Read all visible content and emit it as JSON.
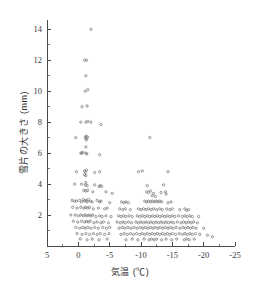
{
  "chart_data": {
    "type": "scatter",
    "title": "",
    "xlabel": "気温 (℃)",
    "ylabel": "雪片の大きさ (mm)",
    "xlim": [
      5,
      -25
    ],
    "ylim": [
      0,
      14.6
    ],
    "x_ticks": [
      5,
      0,
      -5,
      -10,
      -15,
      -20,
      -25
    ],
    "x_tick_labels": [
      "5",
      "0",
      "-5",
      "-10",
      "-15",
      "-20",
      "-25"
    ],
    "x_minor_step": 2.5,
    "y_ticks": [
      2,
      4,
      6,
      8,
      10,
      12,
      14
    ],
    "y_tick_labels": [
      "2",
      "4",
      "6",
      "8",
      "10",
      "12",
      "14"
    ],
    "y_minor_step": 1,
    "grid": false,
    "legend": null,
    "marker": "open-circle",
    "marker_color": "#6e6e6e",
    "axis_color": "#4a4a4a",
    "x_axis_inverted": true,
    "points": [
      [
        -2.0,
        14.0
      ],
      [
        -1.0,
        12.0
      ],
      [
        -1.3,
        12.0
      ],
      [
        -1.2,
        11.0
      ],
      [
        -1.1,
        10.0
      ],
      [
        -1.5,
        10.1
      ],
      [
        -0.6,
        9.0
      ],
      [
        -1.4,
        9.05
      ],
      [
        -0.4,
        8.0
      ],
      [
        -1.2,
        8.0
      ],
      [
        -1.5,
        8.05
      ],
      [
        -2.0,
        8.0
      ],
      [
        -3.6,
        7.85
      ],
      [
        0.4,
        7.0
      ],
      [
        -1.1,
        7.0
      ],
      [
        -1.2,
        7.1
      ],
      [
        -1.35,
        6.95
      ],
      [
        -1.45,
        7.05
      ],
      [
        -1.25,
        6.85
      ],
      [
        -11.4,
        7.0
      ],
      [
        -1.2,
        6.4
      ],
      [
        -0.4,
        6.0
      ],
      [
        -0.55,
        6.0
      ],
      [
        -0.7,
        6.05
      ],
      [
        -1.2,
        6.0
      ],
      [
        -1.35,
        5.95
      ],
      [
        -3.4,
        5.9
      ],
      [
        0.3,
        4.8
      ],
      [
        -1.0,
        4.85
      ],
      [
        -1.15,
        4.75
      ],
      [
        -1.3,
        4.9
      ],
      [
        -1.0,
        4.6
      ],
      [
        -1.2,
        4.55
      ],
      [
        -2.6,
        4.75
      ],
      [
        -3.4,
        4.8
      ],
      [
        -9.6,
        4.8
      ],
      [
        -10.2,
        4.85
      ],
      [
        -14.3,
        4.8
      ],
      [
        0.6,
        4.0
      ],
      [
        -0.5,
        4.0
      ],
      [
        -1.1,
        3.95
      ],
      [
        -1.2,
        4.1
      ],
      [
        -1.4,
        3.9
      ],
      [
        -2.6,
        3.95
      ],
      [
        -3.3,
        3.85
      ],
      [
        -3.5,
        3.9
      ],
      [
        -3.7,
        3.85
      ],
      [
        -11.0,
        3.9
      ],
      [
        -13.6,
        3.95
      ],
      [
        -0.9,
        3.6
      ],
      [
        -1.2,
        3.55
      ],
      [
        -1.5,
        3.6
      ],
      [
        -2.3,
        3.5
      ],
      [
        -4.4,
        3.5
      ],
      [
        -5.4,
        3.4
      ],
      [
        -10.9,
        3.5
      ],
      [
        -11.2,
        3.45
      ],
      [
        -11.5,
        3.55
      ],
      [
        -12.0,
        3.4
      ],
      [
        -13.2,
        3.45
      ],
      [
        -13.9,
        3.5
      ],
      [
        -14.0,
        3.35
      ],
      [
        -11.8,
        3.25
      ],
      [
        -12.3,
        3.2
      ],
      [
        1.0,
        2.95
      ],
      [
        0.6,
        2.9
      ],
      [
        0.3,
        2.9
      ],
      [
        -0.2,
        2.95
      ],
      [
        -0.5,
        2.85
      ],
      [
        -0.8,
        3.0
      ],
      [
        -1.0,
        2.9
      ],
      [
        -1.2,
        2.95
      ],
      [
        -1.4,
        2.85
      ],
      [
        -1.6,
        3.0
      ],
      [
        -1.9,
        2.9
      ],
      [
        -2.2,
        2.85
      ],
      [
        -3.0,
        2.95
      ],
      [
        -3.4,
        2.85
      ],
      [
        -3.6,
        2.9
      ],
      [
        -5.0,
        2.8
      ],
      [
        -6.9,
        2.85
      ],
      [
        -7.3,
        2.8
      ],
      [
        -7.6,
        2.85
      ],
      [
        -8.0,
        2.8
      ],
      [
        -10.6,
        2.9
      ],
      [
        -10.9,
        2.85
      ],
      [
        -11.2,
        2.9
      ],
      [
        -11.5,
        2.85
      ],
      [
        -11.8,
        2.9
      ],
      [
        -12.1,
        2.85
      ],
      [
        -12.4,
        2.9
      ],
      [
        -12.7,
        2.85
      ],
      [
        -13.0,
        2.9
      ],
      [
        -13.3,
        2.85
      ],
      [
        -14.3,
        2.8
      ],
      [
        -14.8,
        2.85
      ],
      [
        0.9,
        2.5
      ],
      [
        0.2,
        2.45
      ],
      [
        -0.4,
        2.5
      ],
      [
        -0.9,
        2.45
      ],
      [
        -1.2,
        2.5
      ],
      [
        -1.5,
        2.45
      ],
      [
        -1.8,
        2.5
      ],
      [
        -2.4,
        2.4
      ],
      [
        -3.2,
        2.45
      ],
      [
        -4.2,
        2.4
      ],
      [
        -4.6,
        2.45
      ],
      [
        -6.6,
        2.4
      ],
      [
        -7.1,
        2.35
      ],
      [
        -7.5,
        2.4
      ],
      [
        -8.3,
        2.35
      ],
      [
        -9.6,
        2.4
      ],
      [
        -10.0,
        2.35
      ],
      [
        -10.4,
        2.4
      ],
      [
        -10.8,
        2.35
      ],
      [
        -11.2,
        2.4
      ],
      [
        -11.6,
        2.35
      ],
      [
        -12.0,
        2.4
      ],
      [
        -12.5,
        2.35
      ],
      [
        -13.0,
        2.4
      ],
      [
        -13.4,
        2.35
      ],
      [
        -14.1,
        2.4
      ],
      [
        -14.6,
        2.35
      ],
      [
        -15.0,
        2.4
      ],
      [
        -16.2,
        2.35
      ],
      [
        -17.0,
        2.4
      ],
      [
        -17.3,
        2.3
      ],
      [
        -17.6,
        2.35
      ],
      [
        1.2,
        2.0
      ],
      [
        0.5,
        2.0
      ],
      [
        0.0,
        1.95
      ],
      [
        -0.4,
        2.0
      ],
      [
        -0.8,
        1.95
      ],
      [
        -1.1,
        2.0
      ],
      [
        -1.4,
        1.95
      ],
      [
        -1.7,
        2.0
      ],
      [
        -2.0,
        1.95
      ],
      [
        -2.3,
        2.0
      ],
      [
        -2.8,
        1.9
      ],
      [
        -3.4,
        1.95
      ],
      [
        -3.8,
        1.9
      ],
      [
        -4.4,
        1.95
      ],
      [
        -5.2,
        1.9
      ],
      [
        -6.4,
        1.95
      ],
      [
        -6.8,
        1.9
      ],
      [
        -7.2,
        1.95
      ],
      [
        -7.6,
        1.9
      ],
      [
        -8.1,
        1.95
      ],
      [
        -8.6,
        1.9
      ],
      [
        -9.4,
        1.95
      ],
      [
        -9.8,
        1.9
      ],
      [
        -10.2,
        1.95
      ],
      [
        -10.6,
        1.9
      ],
      [
        -11.0,
        1.95
      ],
      [
        -11.4,
        1.9
      ],
      [
        -11.8,
        1.95
      ],
      [
        -12.2,
        1.9
      ],
      [
        -12.6,
        1.95
      ],
      [
        -13.0,
        1.9
      ],
      [
        -13.4,
        1.95
      ],
      [
        -13.8,
        1.9
      ],
      [
        -14.2,
        1.95
      ],
      [
        -14.6,
        1.9
      ],
      [
        -15.0,
        1.95
      ],
      [
        -15.4,
        1.9
      ],
      [
        -16.0,
        1.95
      ],
      [
        -16.6,
        1.9
      ],
      [
        -17.0,
        1.95
      ],
      [
        -17.4,
        1.9
      ],
      [
        -17.8,
        1.95
      ],
      [
        -18.2,
        1.9
      ],
      [
        -19.2,
        1.9
      ],
      [
        0.8,
        1.6
      ],
      [
        0.1,
        1.55
      ],
      [
        -0.5,
        1.6
      ],
      [
        -1.0,
        1.55
      ],
      [
        -1.3,
        1.6
      ],
      [
        -1.6,
        1.55
      ],
      [
        -1.9,
        1.6
      ],
      [
        -2.5,
        1.5
      ],
      [
        -3.0,
        1.55
      ],
      [
        -3.6,
        1.5
      ],
      [
        -4.0,
        1.55
      ],
      [
        -4.8,
        1.5
      ],
      [
        -6.2,
        1.55
      ],
      [
        -6.7,
        1.5
      ],
      [
        -7.1,
        1.55
      ],
      [
        -7.5,
        1.5
      ],
      [
        -8.0,
        1.55
      ],
      [
        -8.5,
        1.5
      ],
      [
        -9.2,
        1.55
      ],
      [
        -9.6,
        1.5
      ],
      [
        -10.0,
        1.55
      ],
      [
        -10.4,
        1.5
      ],
      [
        -10.8,
        1.55
      ],
      [
        -11.2,
        1.5
      ],
      [
        -11.6,
        1.55
      ],
      [
        -12.0,
        1.5
      ],
      [
        -12.4,
        1.55
      ],
      [
        -12.8,
        1.5
      ],
      [
        -13.2,
        1.55
      ],
      [
        -13.6,
        1.5
      ],
      [
        -14.0,
        1.55
      ],
      [
        -14.4,
        1.5
      ],
      [
        -14.8,
        1.55
      ],
      [
        -15.2,
        1.5
      ],
      [
        -15.8,
        1.55
      ],
      [
        -16.4,
        1.5
      ],
      [
        -16.8,
        1.55
      ],
      [
        -17.2,
        1.5
      ],
      [
        -17.6,
        1.55
      ],
      [
        -18.0,
        1.5
      ],
      [
        -18.4,
        1.55
      ],
      [
        -19.0,
        1.5
      ],
      [
        0.4,
        1.2
      ],
      [
        -0.2,
        1.15
      ],
      [
        -0.7,
        1.2
      ],
      [
        -1.1,
        1.15
      ],
      [
        -1.5,
        1.2
      ],
      [
        -2.0,
        1.15
      ],
      [
        -2.6,
        1.2
      ],
      [
        -3.2,
        1.15
      ],
      [
        -3.9,
        1.2
      ],
      [
        -4.5,
        1.15
      ],
      [
        -5.0,
        1.2
      ],
      [
        -6.5,
        1.15
      ],
      [
        -7.0,
        1.2
      ],
      [
        -7.4,
        1.15
      ],
      [
        -7.9,
        1.2
      ],
      [
        -8.4,
        1.15
      ],
      [
        -8.9,
        1.2
      ],
      [
        -9.4,
        1.15
      ],
      [
        -9.9,
        1.2
      ],
      [
        -10.3,
        1.15
      ],
      [
        -10.7,
        1.2
      ],
      [
        -11.1,
        1.15
      ],
      [
        -11.5,
        1.2
      ],
      [
        -11.9,
        1.15
      ],
      [
        -12.3,
        1.2
      ],
      [
        -12.7,
        1.15
      ],
      [
        -13.1,
        1.2
      ],
      [
        -13.5,
        1.15
      ],
      [
        -13.9,
        1.2
      ],
      [
        -14.3,
        1.15
      ],
      [
        -14.7,
        1.2
      ],
      [
        -15.1,
        1.15
      ],
      [
        -15.6,
        1.2
      ],
      [
        -16.2,
        1.15
      ],
      [
        -16.7,
        1.2
      ],
      [
        -17.1,
        1.15
      ],
      [
        -17.5,
        1.2
      ],
      [
        -17.9,
        1.15
      ],
      [
        -18.3,
        1.2
      ],
      [
        -18.8,
        1.15
      ],
      [
        -20.0,
        1.15
      ],
      [
        0.2,
        0.8
      ],
      [
        -0.6,
        0.75
      ],
      [
        -1.2,
        0.8
      ],
      [
        -1.8,
        0.75
      ],
      [
        -2.4,
        0.8
      ],
      [
        -3.0,
        0.75
      ],
      [
        -3.5,
        0.8
      ],
      [
        -4.2,
        0.75
      ],
      [
        -4.9,
        0.8
      ],
      [
        -6.8,
        0.75
      ],
      [
        -7.3,
        0.8
      ],
      [
        -7.8,
        0.75
      ],
      [
        -8.3,
        0.8
      ],
      [
        -8.8,
        0.75
      ],
      [
        -9.3,
        0.8
      ],
      [
        -9.8,
        0.75
      ],
      [
        -10.2,
        0.8
      ],
      [
        -10.6,
        0.75
      ],
      [
        -11.0,
        0.8
      ],
      [
        -11.4,
        0.75
      ],
      [
        -11.8,
        0.8
      ],
      [
        -12.2,
        0.75
      ],
      [
        -12.6,
        0.8
      ],
      [
        -13.0,
        0.75
      ],
      [
        -13.4,
        0.8
      ],
      [
        -13.8,
        0.75
      ],
      [
        -14.2,
        0.8
      ],
      [
        -14.6,
        0.75
      ],
      [
        -15.0,
        0.8
      ],
      [
        -15.5,
        0.75
      ],
      [
        -16.1,
        0.8
      ],
      [
        -16.6,
        0.75
      ],
      [
        -17.0,
        0.8
      ],
      [
        -17.4,
        0.75
      ],
      [
        -17.8,
        0.8
      ],
      [
        -18.2,
        0.75
      ],
      [
        -18.7,
        0.8
      ],
      [
        -19.4,
        0.75
      ],
      [
        -20.6,
        0.7
      ],
      [
        -21.4,
        0.6
      ],
      [
        -0.3,
        0.45
      ],
      [
        -1.4,
        0.4
      ],
      [
        -2.2,
        0.45
      ],
      [
        -3.3,
        0.4
      ],
      [
        -4.6,
        0.45
      ],
      [
        -7.6,
        0.4
      ],
      [
        -8.6,
        0.45
      ],
      [
        -9.5,
        0.4
      ],
      [
        -10.5,
        0.45
      ],
      [
        -11.3,
        0.4
      ],
      [
        -11.7,
        0.45
      ],
      [
        -12.1,
        0.4
      ],
      [
        -12.5,
        0.45
      ],
      [
        -13.3,
        0.4
      ],
      [
        -14.0,
        0.45
      ],
      [
        -14.9,
        0.4
      ],
      [
        -15.7,
        0.45
      ],
      [
        -16.9,
        0.4
      ],
      [
        -17.3,
        0.45
      ],
      [
        -17.7,
        0.4
      ],
      [
        -18.5,
        0.45
      ]
    ]
  }
}
